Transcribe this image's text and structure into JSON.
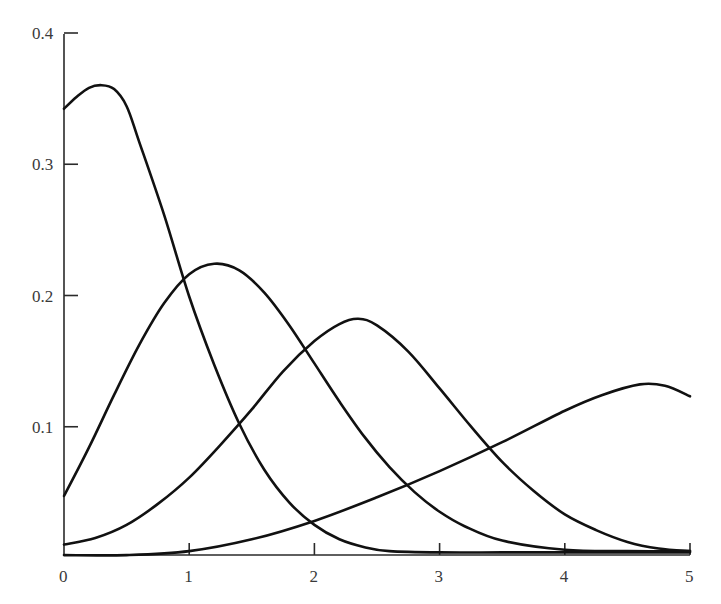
{
  "chart_data": {
    "type": "line",
    "title": "",
    "xlabel": "",
    "ylabel": "",
    "xlim": [
      0,
      5
    ],
    "ylim": [
      0,
      0.4
    ],
    "grid": false,
    "legend": null,
    "x_ticks": [
      "0",
      "1",
      "2",
      "3",
      "4",
      "5"
    ],
    "y_ticks": [
      "0.1",
      "0.2",
      "0.3",
      "0.4"
    ],
    "series": [
      {
        "name": "curve-1",
        "x": [
          0,
          0.1,
          0.2,
          0.3,
          0.4,
          0.5,
          0.6,
          0.8,
          1.0,
          1.2,
          1.4,
          1.6,
          1.8,
          2.0,
          2.2,
          2.4,
          2.6,
          3.0,
          3.5,
          4.0,
          4.5,
          5.0
        ],
        "y": [
          0.343,
          0.352,
          0.359,
          0.361,
          0.358,
          0.345,
          0.318,
          0.262,
          0.2,
          0.148,
          0.103,
          0.068,
          0.043,
          0.026,
          0.015,
          0.009,
          0.006,
          0.005,
          0.005,
          0.005,
          0.005,
          0.005
        ]
      },
      {
        "name": "curve-2",
        "x": [
          0,
          0.2,
          0.4,
          0.6,
          0.8,
          1.0,
          1.2,
          1.4,
          1.6,
          1.8,
          2.0,
          2.2,
          2.4,
          2.6,
          2.8,
          3.0,
          3.2,
          3.5,
          4.0,
          4.5,
          5.0
        ],
        "y": [
          0.048,
          0.085,
          0.125,
          0.163,
          0.195,
          0.217,
          0.225,
          0.22,
          0.203,
          0.178,
          0.149,
          0.12,
          0.093,
          0.07,
          0.051,
          0.036,
          0.025,
          0.014,
          0.007,
          0.006,
          0.006
        ]
      },
      {
        "name": "curve-3",
        "x": [
          0,
          0.25,
          0.5,
          0.75,
          1.0,
          1.25,
          1.5,
          1.75,
          2.0,
          2.2,
          2.35,
          2.5,
          2.75,
          3.0,
          3.25,
          3.5,
          3.75,
          4.0,
          4.25,
          4.5,
          4.75,
          5.0
        ],
        "y": [
          0.011,
          0.016,
          0.026,
          0.042,
          0.062,
          0.087,
          0.114,
          0.143,
          0.166,
          0.179,
          0.183,
          0.178,
          0.158,
          0.13,
          0.101,
          0.074,
          0.052,
          0.034,
          0.022,
          0.013,
          0.008,
          0.006
        ]
      },
      {
        "name": "curve-4",
        "x": [
          0,
          0.5,
          1.0,
          1.5,
          2.0,
          2.5,
          3.0,
          3.5,
          4.0,
          4.3,
          4.6,
          4.8,
          5.0
        ],
        "y": [
          0.003,
          0.003,
          0.006,
          0.015,
          0.029,
          0.047,
          0.067,
          0.089,
          0.113,
          0.125,
          0.133,
          0.132,
          0.124
        ]
      }
    ],
    "pixel_mapping": {
      "x0_px": 64,
      "x_px_per_unit": 125.2,
      "y0_px": 559,
      "y_px_per_unit": 1312.5,
      "axis_y_px": 555,
      "axis_x_px": 64,
      "axis_top_px": 34
    }
  }
}
